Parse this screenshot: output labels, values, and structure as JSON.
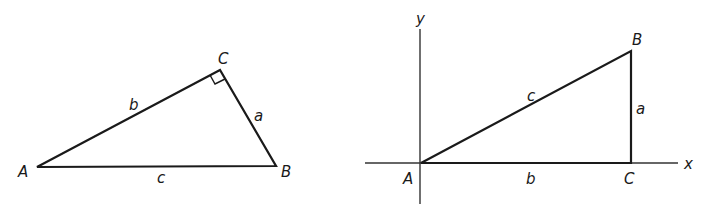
{
  "figure_left": {
    "vertices": {
      "A": "A",
      "B": "B",
      "C": "C"
    },
    "sides": {
      "a": "a",
      "b": "b",
      "c": "c"
    },
    "right_angle_at": "C"
  },
  "figure_right": {
    "axes": {
      "x": "x",
      "y": "y"
    },
    "vertices": {
      "A": "A",
      "B": "B",
      "C": "C"
    },
    "sides": {
      "a": "a",
      "b": "b",
      "c": "c"
    }
  },
  "colors": {
    "stroke": "#1a1a1a",
    "background": "#ffffff"
  }
}
